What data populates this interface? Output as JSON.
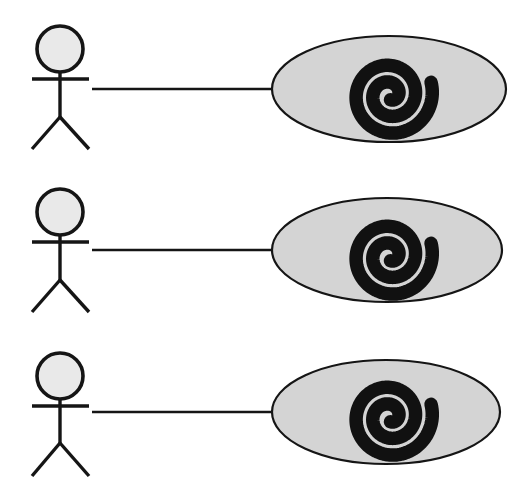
{
  "diagram": {
    "kind": "uml-use-case-diagram",
    "title": "",
    "canvas": {
      "width": 527,
      "height": 496
    },
    "background_color": "#ffffff",
    "stroke_color": "#151515",
    "actor_head_fill": "#e9e9e9",
    "usecase_fill": "#d4d4d4",
    "glyph_color": "#111111",
    "actor_label": "",
    "usecase_label": "",
    "usecase_glyph_name": "spiral-glyph",
    "rows": [
      {
        "id": "row-1",
        "actor": {
          "name": "",
          "head": {
            "cx": 60,
            "cy": 49,
            "r": 23
          },
          "arms": {
            "x1": 32,
            "x2": 89,
            "y": 79
          },
          "spine": {
            "x": 60,
            "y1": 72,
            "y2": 117
          },
          "leg_left": {
            "x": 32,
            "y": 149
          },
          "leg_right": {
            "x": 89,
            "y": 149
          }
        },
        "usecase": {
          "name": "",
          "ellipse": {
            "cx": 389,
            "cy": 89,
            "rx": 117,
            "ry": 53
          },
          "glyph": {
            "cx": 390,
            "cy": 95,
            "size": 86
          }
        },
        "association": {
          "x1": 92,
          "x2": 272,
          "y": 89
        }
      },
      {
        "id": "row-2",
        "actor": {
          "name": "",
          "head": {
            "cx": 60,
            "cy": 212,
            "r": 23
          },
          "arms": {
            "x1": 32,
            "x2": 89,
            "y": 242
          },
          "spine": {
            "x": 60,
            "y1": 235,
            "y2": 280
          },
          "leg_left": {
            "x": 32,
            "y": 312
          },
          "leg_right": {
            "x": 89,
            "y": 312
          }
        },
        "usecase": {
          "name": "",
          "ellipse": {
            "cx": 387,
            "cy": 250,
            "rx": 115,
            "ry": 52
          },
          "glyph": {
            "cx": 390,
            "cy": 256,
            "size": 86
          }
        },
        "association": {
          "x1": 92,
          "x2": 272,
          "y": 250
        }
      },
      {
        "id": "row-3",
        "actor": {
          "name": "",
          "head": {
            "cx": 60,
            "cy": 376,
            "r": 23
          },
          "arms": {
            "x1": 32,
            "x2": 89,
            "y": 406
          },
          "spine": {
            "x": 60,
            "y1": 399,
            "y2": 443
          },
          "leg_left": {
            "x": 32,
            "y": 476
          },
          "leg_right": {
            "x": 89,
            "y": 476
          }
        },
        "usecase": {
          "name": "",
          "ellipse": {
            "cx": 386,
            "cy": 412,
            "rx": 114,
            "ry": 52
          },
          "glyph": {
            "cx": 390,
            "cy": 417,
            "size": 86
          }
        },
        "association": {
          "x1": 92,
          "x2": 272,
          "y": 412
        }
      }
    ]
  }
}
